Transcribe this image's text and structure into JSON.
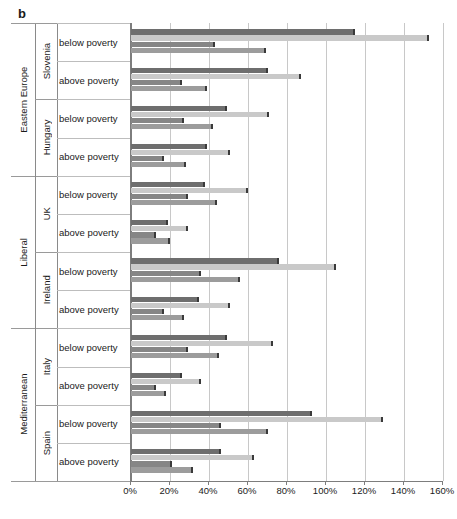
{
  "panel": {
    "label": "b"
  },
  "axis": {
    "x_ticks": [
      "0%",
      "20%",
      "40%",
      "60%",
      "80%",
      "100%",
      "120%",
      "140%",
      "160%"
    ],
    "xlim_min": 0,
    "xlim_max": 160,
    "tick_step": 20
  },
  "labels": {
    "below": "below poverty",
    "above": "above poverty"
  },
  "regimes": [
    {
      "name": "Eastern Europe",
      "countries": [
        "Slovenia",
        "Hungary"
      ]
    },
    {
      "name": "Liberal",
      "countries": [
        "UK",
        "Ireland"
      ]
    },
    {
      "name": "Mediterranean",
      "countries": [
        "Italy",
        "Spain"
      ]
    }
  ],
  "colors": {
    "series1": "#6e6e6e",
    "series2": "#c9c9c9",
    "series3": "#868686",
    "series4": "#9c9c9c",
    "gridline": "#c8c8c8",
    "axis": "#7d7d7d"
  },
  "chart_data": {
    "type": "bar",
    "orientation": "horizontal",
    "title": "",
    "xlabel": "",
    "ylabel": "",
    "xlim": [
      0,
      160
    ],
    "grid": true,
    "legend": "none",
    "tick_labels": [
      "0%",
      "20%",
      "40%",
      "60%",
      "80%",
      "100%",
      "120%",
      "140%",
      "160%"
    ],
    "series_names": [
      "series 1",
      "series 2",
      "series 3",
      "series 4"
    ],
    "groups": [
      {
        "regime": "Eastern Europe",
        "country": "Slovenia",
        "poverty": "below poverty",
        "values": [
          115,
          153,
          43,
          69
        ]
      },
      {
        "regime": "Eastern Europe",
        "country": "Slovenia",
        "poverty": "above poverty",
        "values": [
          70,
          87,
          26,
          39
        ]
      },
      {
        "regime": "Eastern Europe",
        "country": "Hungary",
        "poverty": "below poverty",
        "values": [
          49,
          71,
          27,
          42
        ]
      },
      {
        "regime": "Eastern Europe",
        "country": "Hungary",
        "poverty": "above poverty",
        "values": [
          39,
          51,
          17,
          28
        ]
      },
      {
        "regime": "Liberal",
        "country": "UK",
        "poverty": "below poverty",
        "values": [
          38,
          60,
          29,
          44
        ]
      },
      {
        "regime": "Liberal",
        "country": "UK",
        "poverty": "above poverty",
        "values": [
          19,
          29,
          13,
          20
        ]
      },
      {
        "regime": "Liberal",
        "country": "Ireland",
        "poverty": "below poverty",
        "values": [
          76,
          105,
          36,
          56
        ]
      },
      {
        "regime": "Liberal",
        "country": "Ireland",
        "poverty": "above poverty",
        "values": [
          35,
          51,
          17,
          27
        ]
      },
      {
        "regime": "Mediterranean",
        "country": "Italy",
        "poverty": "below poverty",
        "values": [
          49,
          73,
          29,
          45
        ]
      },
      {
        "regime": "Mediterranean",
        "country": "Italy",
        "poverty": "above poverty",
        "values": [
          26,
          36,
          13,
          18
        ]
      },
      {
        "regime": "Mediterranean",
        "country": "Spain",
        "poverty": "below poverty",
        "values": [
          93,
          129,
          46,
          70
        ]
      },
      {
        "regime": "Mediterranean",
        "country": "Spain",
        "poverty": "above poverty",
        "values": [
          46,
          63,
          21,
          32
        ]
      }
    ]
  }
}
